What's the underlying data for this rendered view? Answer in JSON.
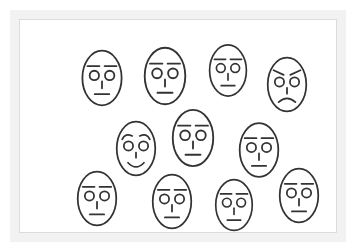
{
  "scene": {
    "title": "Crowd of schematic faces",
    "description": "Array of eleven simple line-drawn oval faces; nine neutral, one angry, one happy",
    "frame_color": "#f2f2f2",
    "canvas_color": "#ffffff",
    "stroke_color": "#333333",
    "face_count": 11,
    "neutral_count": 9,
    "angry_count": 1,
    "happy_count": 1
  },
  "faces": [
    {
      "id": "face-1",
      "label": "neutral-face-row1-col1",
      "expression": "neutral",
      "row": 1,
      "column": 1,
      "x": 60,
      "y": 29,
      "width": 44,
      "height": 58
    },
    {
      "id": "face-2",
      "label": "neutral-face-row1-col2",
      "expression": "neutral",
      "row": 1,
      "column": 2,
      "x": 122,
      "y": 26,
      "width": 46,
      "height": 60
    },
    {
      "id": "face-3",
      "label": "neutral-face-row1-col3",
      "expression": "neutral",
      "row": 1,
      "column": 3,
      "x": 188,
      "y": 23,
      "width": 40,
      "height": 55
    },
    {
      "id": "face-4",
      "label": "angry-face-row1-col4",
      "expression": "angry",
      "row": 1,
      "column": 4,
      "x": 246,
      "y": 36,
      "width": 42,
      "height": 57
    },
    {
      "id": "face-5",
      "label": "happy-face-row2-col1",
      "expression": "happy",
      "row": 2,
      "column": 1,
      "x": 95,
      "y": 100,
      "width": 42,
      "height": 57
    },
    {
      "id": "face-6",
      "label": "neutral-face-row2-col2",
      "expression": "neutral",
      "row": 2,
      "column": 2,
      "x": 151,
      "y": 88,
      "width": 44,
      "height": 60
    },
    {
      "id": "face-7",
      "label": "neutral-face-row2-col3",
      "expression": "neutral",
      "row": 2,
      "column": 3,
      "x": 218,
      "y": 101,
      "width": 42,
      "height": 58
    },
    {
      "id": "face-8",
      "label": "neutral-face-row3-col1",
      "expression": "neutral",
      "row": 3,
      "column": 1,
      "x": 56,
      "y": 150,
      "width": 42,
      "height": 57
    },
    {
      "id": "face-9",
      "label": "neutral-face-row3-col2",
      "expression": "neutral",
      "row": 3,
      "column": 2,
      "x": 131,
      "y": 153,
      "width": 42,
      "height": 57
    },
    {
      "id": "face-10",
      "label": "neutral-face-row3-col3",
      "expression": "neutral",
      "row": 3,
      "column": 3,
      "x": 194,
      "y": 158,
      "width": 40,
      "height": 54
    },
    {
      "id": "face-11",
      "label": "neutral-face-row3-col4",
      "expression": "neutral",
      "row": 3,
      "column": 4,
      "x": 258,
      "y": 147,
      "width": 42,
      "height": 57
    }
  ]
}
